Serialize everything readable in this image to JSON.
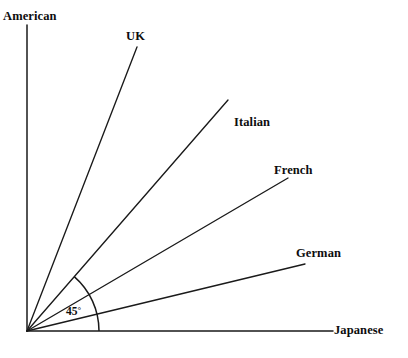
{
  "figure": {
    "width": 408,
    "height": 358,
    "background_color": "#ffffff",
    "line_color": "#1a1a1a",
    "text_color": "#0d0d0d"
  },
  "origin": {
    "x": 27,
    "y": 331
  },
  "angle_marker": {
    "label": "45",
    "degree_symbol": "°",
    "full_label": "45°",
    "radius": 72,
    "start_angle_deg": 0,
    "end_angle_deg": 49,
    "label_x": 66,
    "label_y": 306
  },
  "chart_data": {
    "type": "line",
    "title": "",
    "xlabel": "",
    "ylabel": "",
    "categories": [
      "American",
      "UK",
      "Italian",
      "French",
      "German",
      "Japanese"
    ],
    "values": [
      90.0,
      68.8,
      49.0,
      30.4,
      13.5,
      0.0
    ],
    "value_unit": "degrees",
    "ylim": [
      0,
      90
    ],
    "grid": false,
    "legend": "none",
    "annotations": [
      "45°"
    ]
  },
  "rays": [
    {
      "name": "american",
      "label": "American",
      "angle_deg": 90.0,
      "x1": 27,
      "y1": 331,
      "x2": 27,
      "y2": 25,
      "label_x": 3,
      "label_y": 10,
      "is_axis": true
    },
    {
      "name": "uk",
      "label": "UK",
      "angle_deg": 68.8,
      "x1": 27,
      "y1": 331,
      "x2": 137,
      "y2": 47,
      "label_x": 126,
      "label_y": 30,
      "is_axis": false
    },
    {
      "name": "italian",
      "label": "Italian",
      "angle_deg": 49.0,
      "x1": 27,
      "y1": 331,
      "x2": 228,
      "y2": 100,
      "label_x": 234,
      "label_y": 116,
      "is_axis": false
    },
    {
      "name": "french",
      "label": "French",
      "angle_deg": 30.4,
      "x1": 27,
      "y1": 331,
      "x2": 288,
      "y2": 178,
      "label_x": 274,
      "label_y": 164,
      "is_axis": false
    },
    {
      "name": "german",
      "label": "German",
      "angle_deg": 13.5,
      "x1": 27,
      "y1": 331,
      "x2": 305,
      "y2": 264,
      "label_x": 296,
      "label_y": 247,
      "is_axis": false
    },
    {
      "name": "japanese",
      "label": "Japanese",
      "angle_deg": 0.0,
      "x1": 27,
      "y1": 331,
      "x2": 333,
      "y2": 331,
      "label_x": 334,
      "label_y": 324,
      "is_axis": true
    }
  ]
}
